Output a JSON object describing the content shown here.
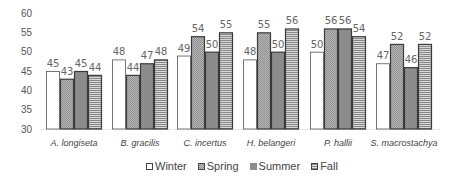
{
  "chart_data": {
    "type": "bar",
    "title": "",
    "xlabel": "",
    "ylabel": "",
    "ylim": [
      30,
      60
    ],
    "yticks": [
      30,
      35,
      40,
      45,
      50,
      55,
      60
    ],
    "grid": false,
    "legend_position": "bottom",
    "categories": [
      "A. longiseta",
      "B. gracilis",
      "C. incertus",
      "H. belangeri",
      "P. hallii",
      "S. macrostachya"
    ],
    "series": [
      {
        "name": "Winter",
        "pattern": "white",
        "values": [
          45,
          48,
          49,
          48,
          50,
          47
        ]
      },
      {
        "name": "Spring",
        "pattern": "checker",
        "values": [
          43,
          44,
          54,
          55,
          56,
          52
        ]
      },
      {
        "name": "Summer",
        "pattern": "dark-gray",
        "values": [
          45,
          47,
          50,
          50,
          56,
          46
        ]
      },
      {
        "name": "Fall",
        "pattern": "horizontal-lines",
        "values": [
          44,
          48,
          55,
          56,
          54,
          52
        ]
      }
    ]
  },
  "colors": {
    "winter": "#ffffff",
    "spring": "#a9a9a9",
    "summer": "#8c8c8c",
    "fall_line": "#9a9a9a",
    "border": "#3a3a3a",
    "axis_text": "#555555"
  }
}
